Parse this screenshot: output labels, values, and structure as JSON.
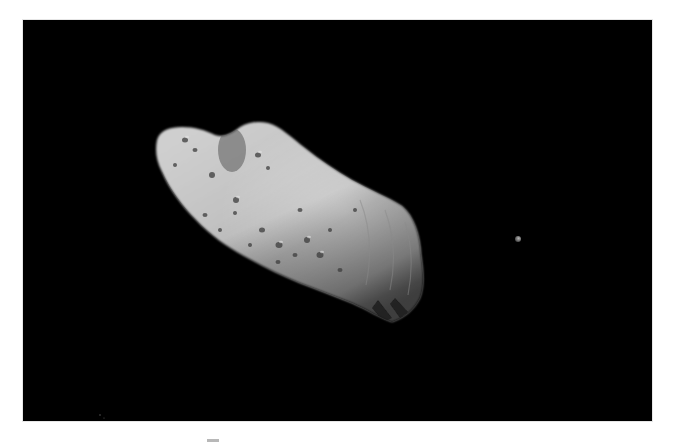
{
  "image": {
    "subject": "asteroid-ida-with-moon-dactyl",
    "background_color": "#000000",
    "page_color": "#ffffff",
    "frame": {
      "x": 23,
      "y": 20,
      "width": 629,
      "height": 401
    },
    "asteroid": {
      "center_approx": [
        290,
        220
      ],
      "tone_light": "#d6d6d6",
      "tone_mid": "#9a9a9a",
      "tone_dark": "#3a3a3a"
    },
    "moon": {
      "center": [
        518,
        239
      ],
      "radius": 3,
      "tone": "#8c8c8c"
    }
  }
}
